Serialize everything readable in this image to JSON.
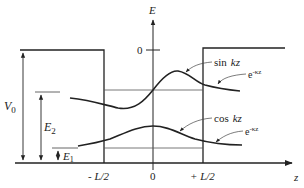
{
  "diagram": {
    "colors": {
      "ink": "#222222",
      "thin": "#555555",
      "background": "#ffffff"
    },
    "axes": {
      "energy_label": "E",
      "energy_zero_label": "0",
      "position_label": "z",
      "position_ticks": [
        "- L/2",
        "0",
        "+ L/2"
      ]
    },
    "levels": {
      "V0_label": "V",
      "V0_sub": "0",
      "E2_label": "E",
      "E2_sub": "2",
      "E1_label": "E",
      "E1_sub": "1"
    },
    "curves": [
      {
        "name": "sin",
        "inside_label": "sin",
        "inside_arg": "kz",
        "outside_label": "e",
        "outside_exp": "-κz"
      },
      {
        "name": "cos",
        "inside_label": "cos",
        "inside_arg": "kz",
        "outside_label": "e",
        "outside_exp": "-κz"
      }
    ]
  }
}
